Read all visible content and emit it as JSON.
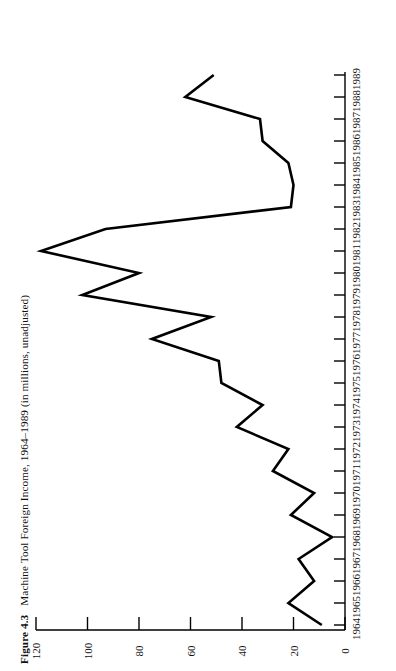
{
  "caption": {
    "figure_number": "Figure 4.3",
    "title": "Machine Tool Foreign Income, 1964–1989 (in millions, unadjusted)"
  },
  "chart_data": {
    "type": "line",
    "title": "Machine Tool Foreign Income, 1964–1989 (in millions, unadjusted)",
    "orientation": "rotated-90",
    "xlabel": "",
    "ylabel": "",
    "grid": false,
    "legend": null,
    "value_axis": {
      "ticks": [
        120,
        100,
        80,
        60,
        40,
        20,
        0
      ],
      "tick_labels": [
        "120",
        "100",
        "80",
        "60",
        "40",
        "20",
        "0"
      ],
      "range": [
        0,
        120
      ]
    },
    "categories": [
      "1964",
      "1965",
      "1966",
      "1967",
      "1968",
      "1969",
      "1970",
      "1971",
      "1972",
      "1973",
      "1974",
      "1975",
      "1976",
      "1977",
      "1978",
      "1979",
      "1980",
      "1981",
      "1982",
      "1983",
      "1984",
      "1985",
      "1986",
      "1987",
      "1988",
      "1989"
    ],
    "values": [
      9,
      22,
      12,
      18,
      5,
      21,
      12,
      28,
      22,
      42,
      32,
      48,
      49,
      75,
      52,
      102,
      80,
      118,
      93,
      21,
      20,
      22,
      32,
      33,
      62,
      51
    ]
  }
}
